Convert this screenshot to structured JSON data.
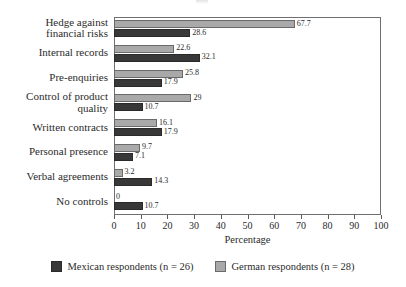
{
  "chart_data": {
    "type": "bar",
    "orientation": "horizontal",
    "title": "",
    "xlabel": "Percentage",
    "ylabel": "",
    "xlim": [
      0,
      100
    ],
    "xticks": [
      0,
      10,
      20,
      30,
      40,
      50,
      60,
      70,
      80,
      90,
      100
    ],
    "grid": false,
    "legend_position": "bottom",
    "categories": [
      "Hedge against\nfinancial risks",
      "Internal records",
      "Pre-enquiries",
      "Control of product\nquality",
      "Written contracts",
      "Personal presence",
      "Verbal agreements",
      "No controls"
    ],
    "category_lines": [
      [
        "Hedge against",
        "financial risks"
      ],
      [
        "Internal records"
      ],
      [
        "Pre-enquiries"
      ],
      [
        "Control of product",
        "quality"
      ],
      [
        "Written contracts"
      ],
      [
        "Personal presence"
      ],
      [
        "Verbal agreements"
      ],
      [
        "No controls"
      ]
    ],
    "series": [
      {
        "name": "German respondents (n = 28)",
        "color": "#a9a9a9",
        "values": [
          67.7,
          22.6,
          25.8,
          29,
          16.1,
          9.7,
          3.2,
          0
        ],
        "labels": [
          "67.7",
          "22.6",
          "25.8",
          "29",
          "16.1",
          "9.7",
          "3.2",
          "0"
        ]
      },
      {
        "name": "Mexican respondents (n = 26)",
        "color": "#383838",
        "values": [
          28.6,
          32.1,
          17.9,
          10.7,
          17.9,
          7.1,
          14.3,
          10.7
        ],
        "labels": [
          "28.6",
          "32.1",
          "17.9",
          "10.7",
          "17.9",
          "7.1",
          "14.3",
          "10.7"
        ]
      }
    ]
  },
  "legend": {
    "items": [
      {
        "label": "Mexican respondents (n = 26)",
        "color": "#383838"
      },
      {
        "label": "German respondents (n = 28)",
        "color": "#a9a9a9"
      }
    ]
  },
  "axis": {
    "x_title": "Percentage"
  }
}
